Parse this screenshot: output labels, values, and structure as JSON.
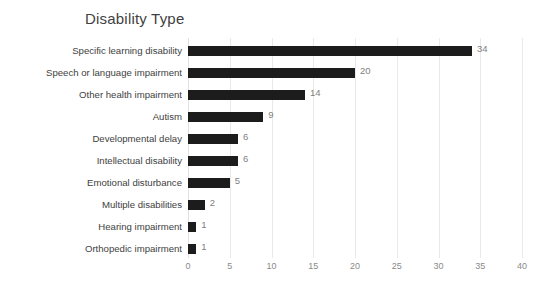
{
  "chart_data": {
    "type": "bar",
    "orientation": "horizontal",
    "title": "Disability Type",
    "xlabel": "",
    "ylabel": "",
    "xlim": [
      0,
      40
    ],
    "xticks": [
      0,
      5,
      10,
      15,
      20,
      25,
      30,
      35,
      40
    ],
    "grid": true,
    "legend": false,
    "bar_color": "#1c1c1c",
    "value_label_color": "#808080",
    "categories": [
      "Specific learning disability",
      "Speech or language impairment",
      "Other health impairment",
      "Autism",
      "Developmental delay",
      "Intellectual disability",
      "Emotional disturbance",
      "Multiple disabilities",
      "Hearing impairment",
      "Orthopedic impairment"
    ],
    "values": [
      34,
      20,
      14,
      9,
      6,
      6,
      5,
      2,
      1,
      1
    ],
    "value_labels": [
      "34",
      "20",
      "14",
      "9",
      "6",
      "6",
      "5",
      "2",
      "1",
      "1"
    ],
    "tick_labels": [
      "0",
      "5",
      "10",
      "15",
      "20",
      "25",
      "30",
      "35",
      "40"
    ]
  }
}
